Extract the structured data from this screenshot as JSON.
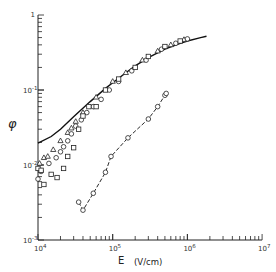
{
  "chart_data": {
    "type": "scatter",
    "title": "",
    "xlabel": "E (V/cm)",
    "ylabel": "φ",
    "xscale": "log",
    "yscale": "log",
    "xlim": [
      10000,
      10000000
    ],
    "ylim": [
      0.001,
      1
    ],
    "grid": false,
    "legend": null,
    "x_tick_labels": [
      "10^4",
      "10^5",
      "10^6",
      "10^7"
    ],
    "y_tick_labels": [
      "10^-3",
      "10^-2",
      "10^-1",
      "1"
    ],
    "series": [
      {
        "name": "theory curve",
        "kind": "line",
        "style": "solid",
        "points": [
          [
            10000,
            0.0195
          ],
          [
            15000,
            0.024
          ],
          [
            20000,
            0.03
          ],
          [
            30000,
            0.044
          ],
          [
            50000,
            0.07
          ],
          [
            80000,
            0.105
          ],
          [
            100000,
            0.125
          ],
          [
            150000,
            0.17
          ],
          [
            200000,
            0.21
          ],
          [
            300000,
            0.27
          ],
          [
            500000,
            0.35
          ],
          [
            800000,
            0.42
          ],
          [
            1000000,
            0.45
          ],
          [
            1500000,
            0.5
          ],
          [
            1800000,
            0.52
          ]
        ]
      },
      {
        "name": "triangles",
        "kind": "marker",
        "marker": "triangle",
        "points": [
          [
            10500,
            0.0105
          ],
          [
            12000,
            0.0125
          ],
          [
            13500,
            0.013
          ],
          [
            16000,
            0.016
          ],
          [
            20000,
            0.021
          ],
          [
            25000,
            0.027
          ],
          [
            28000,
            0.031
          ],
          [
            32000,
            0.038
          ],
          [
            40000,
            0.05
          ],
          [
            60000,
            0.08
          ],
          [
            100000,
            0.13
          ],
          [
            150000,
            0.17
          ],
          [
            250000,
            0.25
          ],
          [
            400000,
            0.33
          ],
          [
            600000,
            0.4
          ],
          [
            900000,
            0.47
          ]
        ]
      },
      {
        "name": "circles",
        "kind": "marker",
        "marker": "circle",
        "points": [
          [
            10000,
            0.0065
          ],
          [
            11000,
            0.0082
          ],
          [
            14000,
            0.0105
          ],
          [
            17500,
            0.0125
          ],
          [
            20000,
            0.015
          ],
          [
            22000,
            0.0175
          ],
          [
            25000,
            0.021
          ],
          [
            28000,
            0.026
          ],
          [
            32000,
            0.033
          ],
          [
            38000,
            0.04
          ],
          [
            45000,
            0.05
          ],
          [
            55000,
            0.06
          ],
          [
            70000,
            0.075
          ],
          [
            90000,
            0.1
          ],
          [
            120000,
            0.13
          ],
          [
            180000,
            0.18
          ],
          [
            280000,
            0.25
          ],
          [
            450000,
            0.35
          ],
          [
            700000,
            0.42
          ],
          [
            1000000,
            0.48
          ]
        ]
      },
      {
        "name": "squares",
        "kind": "marker",
        "marker": "square",
        "points": [
          [
            10000,
            0.009
          ],
          [
            11000,
            0.0085
          ],
          [
            12000,
            0.0055
          ],
          [
            15000,
            0.0075
          ],
          [
            18000,
            0.0068
          ],
          [
            22000,
            0.009
          ],
          [
            25000,
            0.013
          ],
          [
            30000,
            0.017
          ],
          [
            35000,
            0.03
          ],
          [
            40000,
            0.045
          ],
          [
            48000,
            0.06
          ],
          [
            60000,
            0.06
          ],
          [
            80000,
            0.1
          ],
          [
            120000,
            0.14
          ],
          [
            200000,
            0.2
          ],
          [
            300000,
            0.28
          ],
          [
            500000,
            0.38
          ],
          [
            800000,
            0.45
          ]
        ]
      },
      {
        "name": "lower circles",
        "kind": "marker+line",
        "marker": "circle",
        "style": "dashed",
        "points": [
          [
            35000,
            0.0032
          ],
          [
            40000,
            0.0025
          ],
          [
            55000,
            0.0042
          ],
          [
            80000,
            0.008
          ],
          [
            95000,
            0.013
          ],
          [
            160000,
            0.023
          ],
          [
            300000,
            0.041
          ],
          [
            400000,
            0.06
          ],
          [
            500000,
            0.085
          ],
          [
            520000,
            0.09
          ]
        ]
      }
    ]
  },
  "axes": {
    "xlabel_letter": "E",
    "xlabel_unit": "(V/cm)",
    "ylabel": "φ"
  }
}
